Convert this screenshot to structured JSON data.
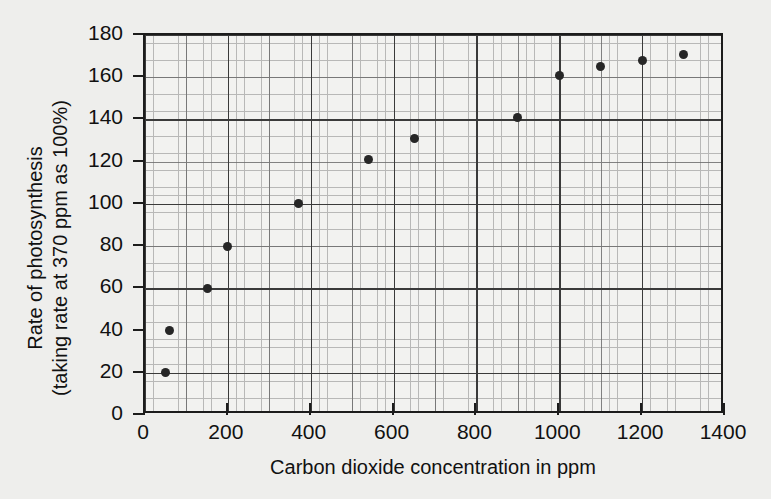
{
  "chart_data": {
    "type": "scatter",
    "title": "",
    "xlabel": "Carbon dioxide concentration in ppm",
    "ylabel_line1": "Rate of photosynthesis",
    "ylabel_line2": "(taking rate at 370 ppm as 100%)",
    "xlim": [
      0,
      1400
    ],
    "ylim": [
      0,
      180
    ],
    "xticks": [
      0,
      200,
      400,
      600,
      800,
      1000,
      1200,
      1400
    ],
    "yticks": [
      0,
      20,
      40,
      60,
      80,
      100,
      120,
      140,
      160,
      180
    ],
    "xtick_labels": [
      "0",
      "200",
      "400",
      "600",
      "800",
      "1000",
      "1200",
      "1400"
    ],
    "ytick_labels": [
      "0",
      "20",
      "40",
      "60",
      "80",
      "100",
      "120",
      "140",
      "160",
      "180"
    ],
    "grid": "graph-paper minor and major gridlines",
    "legend": "none",
    "marker": "filled-circle",
    "marker_color": "#262626",
    "points": [
      {
        "x": 50,
        "y": 20
      },
      {
        "x": 60,
        "y": 40
      },
      {
        "x": 150,
        "y": 60
      },
      {
        "x": 200,
        "y": 80
      },
      {
        "x": 370,
        "y": 100
      },
      {
        "x": 540,
        "y": 121
      },
      {
        "x": 650,
        "y": 131
      },
      {
        "x": 900,
        "y": 141
      },
      {
        "x": 1000,
        "y": 161
      },
      {
        "x": 1100,
        "y": 165
      },
      {
        "x": 1200,
        "y": 168
      },
      {
        "x": 1300,
        "y": 171
      }
    ]
  },
  "colors": {
    "page_background": "#eeeeec",
    "plot_background": "#f2f2f0",
    "axis": "#1c1c1c",
    "grid_major": "#3a3a3a",
    "grid_minor": "#8a8a8a",
    "text": "#111111"
  }
}
